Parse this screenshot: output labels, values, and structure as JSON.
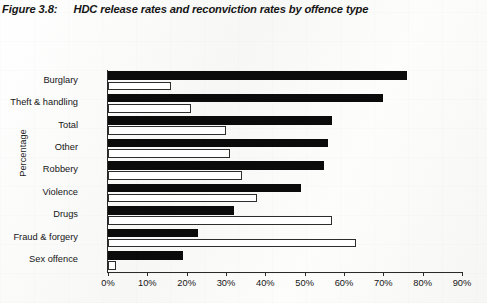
{
  "figure": {
    "number_label": "Figure 3.8:",
    "title": "HDC release rates and reconviction rates by offence type"
  },
  "axes": {
    "y_axis_title": "Percentage",
    "x_ticks": [
      "0%",
      "10%",
      "20%",
      "30%",
      "40%",
      "50%",
      "60%",
      "70%",
      "80%",
      "90%"
    ],
    "categories": [
      "Burglary",
      "Theft & handling",
      "Total",
      "Other",
      "Robbery",
      "Violence",
      "Drugs",
      "Fraud & forgery",
      "Sex offence"
    ]
  },
  "colors": {
    "release_bar": "#0b0b0b",
    "reconviction_bar": "#ffffff",
    "bar_outline": "#2d2d2d",
    "axis": "#2a2a2a",
    "page_background": "#fbfbfa",
    "text": "#161616"
  },
  "chart_data": {
    "type": "bar",
    "orientation": "horizontal",
    "title": "HDC release rates and reconviction rates by offence type",
    "xlabel": "",
    "ylabel": "Percentage",
    "xlim": [
      0,
      90
    ],
    "xtick_step": 10,
    "grid": false,
    "legend": "none",
    "categories": [
      "Burglary",
      "Theft & handling",
      "Total",
      "Other",
      "Robbery",
      "Violence",
      "Drugs",
      "Fraud & forgery",
      "Sex offence"
    ],
    "series": [
      {
        "name": "Release rate",
        "style": "filled-black",
        "values": [
          76,
          70,
          57,
          56,
          55,
          49,
          32,
          23,
          19
        ]
      },
      {
        "name": "Reconviction rate",
        "style": "outlined-white",
        "values": [
          16,
          21,
          30,
          31,
          34,
          38,
          57,
          63,
          2
        ]
      }
    ]
  }
}
